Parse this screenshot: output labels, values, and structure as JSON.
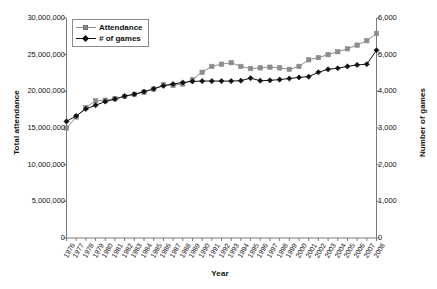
{
  "chart_data": {
    "type": "line",
    "title": "",
    "xlabel": "Year",
    "ylabel": "Total attendance",
    "y2label": "Number of games",
    "grid": false,
    "legend_position": "top-left",
    "xlim": [
      1976,
      2008
    ],
    "ylim": [
      0,
      30000000
    ],
    "y2lim": [
      0,
      6000
    ],
    "ytick_labels": [
      "30,000,000",
      "25,000,000",
      "20,000,000",
      "15,000,000",
      "10,000,000",
      "5,000,000",
      "0"
    ],
    "ytick_values": [
      30000000,
      25000000,
      20000000,
      15000000,
      10000000,
      5000000,
      0
    ],
    "y2tick_labels": [
      "6,000",
      "5,000",
      "4,000",
      "3,000",
      "2,000",
      "1,000",
      "0"
    ],
    "y2tick_values": [
      6000,
      5000,
      4000,
      3000,
      2000,
      1000,
      0
    ],
    "categories": [
      "1976",
      "1977",
      "1978",
      "1979",
      "1980",
      "1981",
      "1982",
      "1983",
      "1984",
      "1985",
      "1986",
      "1987",
      "1988",
      "1989",
      "1990",
      "1991",
      "1992",
      "1993",
      "1994",
      "1995",
      "1996",
      "1997",
      "1998",
      "1999",
      "2000",
      "2001",
      "2002",
      "2003",
      "2004",
      "2005",
      "2006",
      "2007",
      "2008"
    ],
    "series": [
      {
        "name": "Attendance",
        "axis": "left",
        "color": "#8c8c8c",
        "marker": "square",
        "values": [
          15000000,
          16500000,
          17800000,
          18700000,
          18800000,
          19000000,
          19300000,
          19600000,
          19900000,
          20300000,
          20900000,
          20800000,
          21000000,
          21600000,
          22600000,
          23400000,
          23700000,
          23900000,
          23400000,
          23100000,
          23200000,
          23300000,
          23200000,
          23000000,
          23400000,
          24300000,
          24600000,
          25000000,
          25400000,
          25800000,
          26300000,
          26900000,
          27900000
        ]
      },
      {
        "name": "# of games",
        "axis": "right",
        "color": "#111111",
        "marker": "diamond",
        "values": [
          3180,
          3330,
          3520,
          3620,
          3720,
          3790,
          3870,
          3920,
          3990,
          4070,
          4150,
          4200,
          4240,
          4270,
          4280,
          4280,
          4280,
          4280,
          4290,
          4360,
          4290,
          4300,
          4320,
          4350,
          4380,
          4400,
          4520,
          4600,
          4630,
          4680,
          4720,
          4740,
          5120
        ]
      }
    ]
  },
  "legend": {
    "items": [
      {
        "label": "Attendance",
        "marker": "square",
        "color": "#8c8c8c"
      },
      {
        "label": "# of games",
        "marker": "diamond",
        "color": "#111111"
      }
    ]
  },
  "axes": {
    "left_title": "Total attendance",
    "right_title": "Number of games",
    "bottom_title": "Year"
  }
}
